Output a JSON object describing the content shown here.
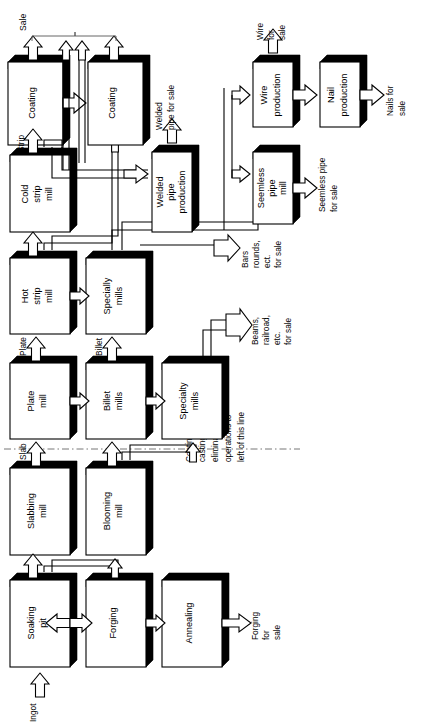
{
  "diagram": {
    "orientation": "rotated-90-ccw",
    "bracket_label": "Sale",
    "note": {
      "line1": "Continuous",
      "line2": "casting",
      "line3": "eliminates",
      "line4": "operations to",
      "line5": "left of this line"
    },
    "colors": {
      "box_fill": "#ffffff",
      "box_stroke": "#000000",
      "shadow": "#000000",
      "arrow_fill": "#ffffff",
      "dash_line": "#666666"
    }
  },
  "boxes": {
    "soaking_pit": {
      "line1": "Soaking",
      "line2": "pit"
    },
    "forging": {
      "line1": "Forging",
      "line2": ""
    },
    "annealing": {
      "line1": "Annealing",
      "line2": ""
    },
    "slabbing_mill": {
      "line1": "Slabbing",
      "line2": "mill"
    },
    "blooming_mill": {
      "line1": "Blooming",
      "line2": "mill"
    },
    "plate_mill": {
      "line1": "Plate",
      "line2": "mill"
    },
    "billet_mills": {
      "line1": "Billet",
      "line2": "mills"
    },
    "specialty_mills_lower": {
      "line1": "Specialty",
      "line2": "mills"
    },
    "hot_strip_mill": {
      "line1": "Hot",
      "line2": "strip",
      "line3": "mill"
    },
    "specialty_mills_upper": {
      "line1": "Specially",
      "line2": "mills"
    },
    "cold_strip_mill": {
      "line1": "Cold",
      "line2": "strip",
      "line3": "mill"
    },
    "coating_one": {
      "line1": "Coating",
      "line2": ""
    },
    "coating_two": {
      "line1": "Coating",
      "line2": ""
    },
    "welded_pipe_production": {
      "line1": "Welded",
      "line2": "pipe",
      "line3": "production"
    },
    "seemless_pipe_mill": {
      "line1": "Seemless",
      "line2": "pipe",
      "line3": "mill"
    },
    "wire_production": {
      "line1": "Wire",
      "line2": "production"
    },
    "nail_production": {
      "line1": "Nail",
      "line2": "production"
    }
  },
  "flow_labels": {
    "ingot": "Ingot",
    "slab": "Slab",
    "plate": "Plate",
    "billet": "Billet",
    "strip": "Strip"
  },
  "outputs": {
    "forging_for_sale": {
      "line1": "Forging",
      "line2": "for",
      "line3": "sale"
    },
    "beams_railroad": {
      "line1": "Beams,",
      "line2": "railroad,",
      "line3": "etc.",
      "line4": "for sale"
    },
    "bars_rounds": {
      "line1": "Bars",
      "line2": "rounds,",
      "line3": "ect.",
      "line4": "for sale"
    },
    "welded_pipe_for_sale": {
      "line1": "Welded",
      "line2": "pipe for sale"
    },
    "seemless_pipe_for_sale": {
      "line1": "Seemless pipe",
      "line2": "for sale"
    },
    "wire_for_sale": {
      "line1": "Wire",
      "line2": "for",
      "line3": "sale"
    },
    "nails_for_sale": {
      "line1": "Nails for",
      "line2": "sale"
    }
  }
}
